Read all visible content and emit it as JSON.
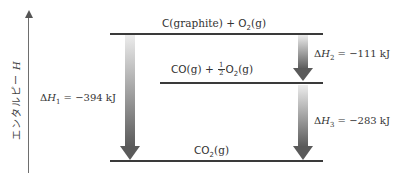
{
  "axis": {
    "label": "エンタルピー",
    "symbol": "H"
  },
  "levels": {
    "top": {
      "species1": "C",
      "species1_state": "(graphite)",
      "plus": "+",
      "species2": "O",
      "species2_sub": "2",
      "species2_state": "(g)"
    },
    "middle": {
      "species1": "CO",
      "species1_state": "(g)",
      "plus": "+",
      "coef_num": "1",
      "coef_den": "2",
      "species2": "O",
      "species2_sub": "2",
      "species2_state": "(g)"
    },
    "bottom": {
      "species1": "CO",
      "species1_sub": "2",
      "species1_state": "(g)"
    }
  },
  "enthalpy_changes": [
    {
      "id": "dH1",
      "delta": "Δ",
      "symbol": "H",
      "sub": "1",
      "eq": " = ",
      "value": "−394 kJ"
    },
    {
      "id": "dH2",
      "delta": "Δ",
      "symbol": "H",
      "sub": "2",
      "eq": " = ",
      "value": "−111 kJ"
    },
    {
      "id": "dH3",
      "delta": "Δ",
      "symbol": "H",
      "sub": "3",
      "eq": " = ",
      "value": "−283 kJ"
    }
  ],
  "colors": {
    "level_line": "#3a3a3a",
    "arrow_light": "#e6e6e6",
    "arrow_dark": "#5a5a5a"
  }
}
